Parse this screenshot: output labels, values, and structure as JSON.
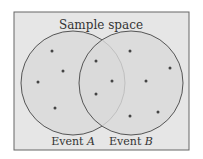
{
  "diagram": {
    "title": "Sample space",
    "events": [
      {
        "name": "Event A",
        "prefix": "Event ",
        "letter": "A"
      },
      {
        "name": "Event B",
        "prefix": "Event ",
        "letter": "B"
      }
    ],
    "outcome_counts": {
      "only_A": 4,
      "A_and_B": 3,
      "only_B": 5
    },
    "colors": {
      "background": "#e6e6e6",
      "circle_fill": "#d9d9d9",
      "border": "#555555",
      "dot": "#444444"
    }
  }
}
